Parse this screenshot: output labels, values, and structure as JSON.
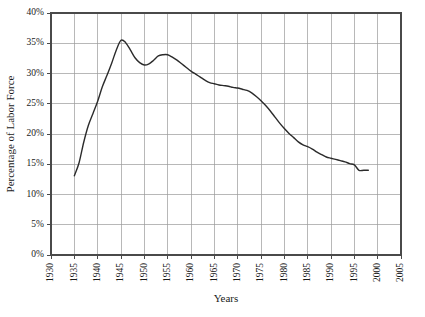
{
  "chart_data": {
    "type": "line",
    "title": "",
    "subtitle": "",
    "xlabel": "Years",
    "ylabel": "Percentage of Labor Force",
    "xlim": [
      1930,
      2005
    ],
    "ylim": [
      0,
      40
    ],
    "grid": true,
    "legend": null,
    "legend_position": "none",
    "x_tick_labels": [
      "1930",
      "1935",
      "1940",
      "1945",
      "1950",
      "1955",
      "1960",
      "1965",
      "1970",
      "1975",
      "1980",
      "1985",
      "1990",
      "1995",
      "2000",
      "2005"
    ],
    "x_ticks": [
      1930,
      1935,
      1940,
      1945,
      1950,
      1955,
      1960,
      1965,
      1970,
      1975,
      1980,
      1985,
      1990,
      1995,
      2000,
      2005
    ],
    "y_tick_labels": [
      "0%",
      "5%",
      "10%",
      "15%",
      "20%",
      "25%",
      "30%",
      "35%",
      "40%"
    ],
    "y_ticks": [
      0,
      5,
      10,
      15,
      20,
      25,
      30,
      35,
      40
    ],
    "x_tick_label_rotation": -90,
    "series": [
      {
        "name": "Percentage of Labor Force",
        "color": "#2b2b2b",
        "x": [
          1935,
          1936,
          1937,
          1938,
          1939,
          1940,
          1941,
          1942,
          1943,
          1944,
          1945,
          1946,
          1947,
          1948,
          1949,
          1950,
          1951,
          1952,
          1953,
          1954,
          1955,
          1956,
          1957,
          1958,
          1959,
          1960,
          1961,
          1962,
          1963,
          1964,
          1965,
          1966,
          1967,
          1968,
          1969,
          1970,
          1971,
          1972,
          1973,
          1974,
          1975,
          1976,
          1977,
          1978,
          1979,
          1980,
          1981,
          1982,
          1983,
          1984,
          1985,
          1986,
          1987,
          1988,
          1989,
          1990,
          1991,
          1992,
          1993,
          1994,
          1995,
          1996,
          1997,
          1998
        ],
        "values": [
          13.1,
          15.2,
          18.6,
          21.4,
          23.4,
          25.4,
          27.8,
          29.7,
          31.7,
          33.9,
          35.5,
          35.1,
          33.9,
          32.6,
          31.8,
          31.4,
          31.6,
          32.2,
          32.9,
          33.1,
          33.1,
          32.7,
          32.2,
          31.6,
          31.0,
          30.4,
          29.9,
          29.4,
          28.9,
          28.5,
          28.3,
          28.1,
          28.0,
          27.9,
          27.7,
          27.6,
          27.4,
          27.2,
          26.8,
          26.2,
          25.5,
          24.7,
          23.8,
          22.8,
          21.8,
          20.9,
          20.1,
          19.4,
          18.7,
          18.2,
          17.9,
          17.5,
          17.0,
          16.6,
          16.2,
          16.0,
          15.8,
          15.6,
          15.4,
          15.1,
          14.9,
          14.0,
          14.0,
          14.0
        ]
      }
    ]
  },
  "axes": {
    "y_title": "Percentage of Labor Force",
    "x_title": "Years"
  },
  "colors": {
    "line": "#2b2b2b",
    "grid": "#9a9a9a",
    "frame": "#4a4a4a",
    "background": "#ffffff"
  }
}
